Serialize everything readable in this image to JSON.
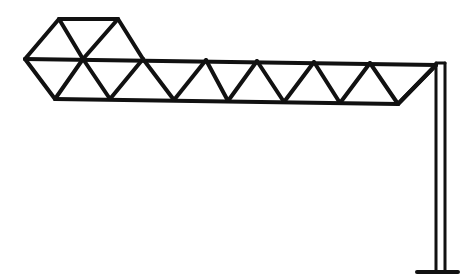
{
  "figure": {
    "stroke_color": "#111111",
    "background": "#ffffff",
    "stroke_width": 4
  },
  "truss": {
    "head_hexagon": {
      "top_chord": [
        [
          59,
          19
        ],
        [
          118,
          19
        ]
      ],
      "left_tip": [
        25,
        59
      ],
      "bottom_left": [
        55,
        99
      ]
    },
    "top_chord_nodes": [
      [
        25,
        59
      ],
      [
        83,
        59
      ],
      [
        143,
        59
      ],
      [
        206,
        60
      ],
      [
        257,
        61
      ],
      [
        314,
        62
      ],
      [
        370,
        63
      ],
      [
        436,
        65
      ]
    ],
    "bottom_chord_nodes": [
      [
        55,
        99
      ],
      [
        110,
        99
      ],
      [
        174,
        100
      ],
      [
        228,
        101
      ],
      [
        284,
        102
      ],
      [
        340,
        103
      ],
      [
        398,
        104
      ]
    ],
    "upper_nodes": [
      [
        59,
        19
      ],
      [
        118,
        19
      ]
    ]
  },
  "post": {
    "left_x": 436,
    "right_x": 445,
    "top_y": 63,
    "bottom_y": 272,
    "base": [
      [
        417,
        272
      ],
      [
        458,
        272
      ]
    ]
  }
}
